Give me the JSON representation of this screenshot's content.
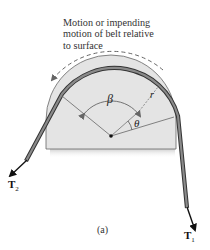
{
  "caption": {
    "lines": [
      "Motion or impending",
      "motion of belt relative",
      "to surface"
    ]
  },
  "labels": {
    "beta": "β",
    "theta": "θ",
    "radius": "r",
    "t2": "T",
    "t2_sub": "2",
    "t1": "T",
    "t1_sub": "1"
  },
  "figure_label": "(a)",
  "colors": {
    "disc_fill": "#e3e3e3",
    "disc_edge": "#555555",
    "belt": "#6e6e6e",
    "belt_edge": "#333333",
    "arrow": "#111111",
    "dashed_motion_arrow": "#666666"
  }
}
